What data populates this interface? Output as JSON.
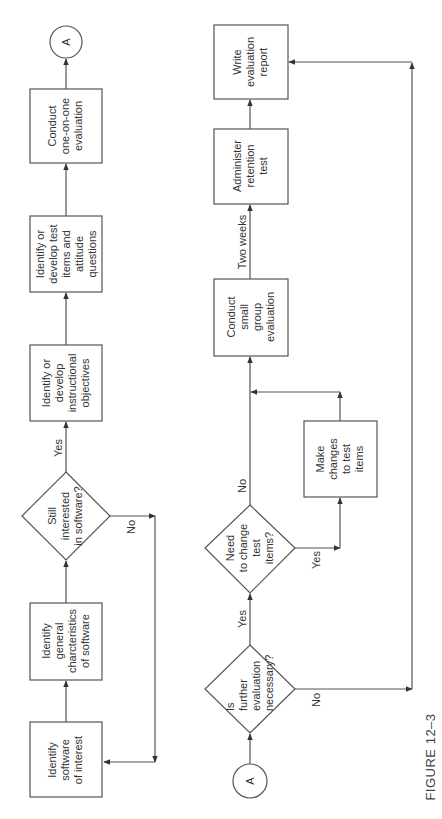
{
  "figure": {
    "caption": "FIGURE 12–3",
    "orientation": "rotated -90 degrees"
  },
  "connector_label": "A",
  "top_flow": {
    "nodes": [
      {
        "id": "identify-software",
        "type": "process",
        "lines": [
          "Identify",
          "software",
          "of interest"
        ]
      },
      {
        "id": "identify-characteristics",
        "type": "process",
        "lines": [
          "Identify",
          "general",
          "charcteristics",
          "of software"
        ]
      },
      {
        "id": "still-interested",
        "type": "decision",
        "lines": [
          "Still",
          "interested",
          "in software?"
        ]
      },
      {
        "id": "identify-objectives",
        "type": "process",
        "lines": [
          "Identify or",
          "develop",
          "instructional",
          "objectives"
        ]
      },
      {
        "id": "identify-test-items",
        "type": "process",
        "lines": [
          "Identify or",
          "develop test",
          "items and",
          "attitude",
          "questions"
        ]
      },
      {
        "id": "conduct-one-on-one",
        "type": "process",
        "lines": [
          "Conduct",
          "one-on-one",
          "evaluation"
        ]
      },
      {
        "id": "connector-a-out",
        "type": "connector",
        "lines": [
          "A"
        ]
      }
    ],
    "edge_labels": {
      "yes": "Yes",
      "no": "No"
    }
  },
  "bottom_flow": {
    "nodes": [
      {
        "id": "connector-a-in",
        "type": "connector",
        "lines": [
          "A"
        ]
      },
      {
        "id": "further-evaluation",
        "type": "decision",
        "lines": [
          "Is",
          "further",
          "evaluation",
          "necessary?"
        ]
      },
      {
        "id": "need-change",
        "type": "decision",
        "lines": [
          "Need",
          "to change",
          "test",
          "items?"
        ]
      },
      {
        "id": "make-changes",
        "type": "process",
        "lines": [
          "Make",
          "changes",
          "to test",
          "items"
        ]
      },
      {
        "id": "small-group",
        "type": "process",
        "lines": [
          "Conduct",
          "small",
          "group",
          "evaluation"
        ]
      },
      {
        "id": "retention-test",
        "type": "process",
        "lines": [
          "Administer",
          "retention",
          "test"
        ]
      },
      {
        "id": "write-report",
        "type": "process",
        "lines": [
          "Write",
          "evaluation",
          "report"
        ]
      }
    ],
    "edge_labels": {
      "further_yes": "Yes",
      "further_no": "No",
      "change_yes": "Yes",
      "change_no": "No",
      "two_weeks": "Two weeks"
    }
  },
  "colors": {
    "stroke": "#555555",
    "text": "#333333",
    "background": "#ffffff"
  }
}
